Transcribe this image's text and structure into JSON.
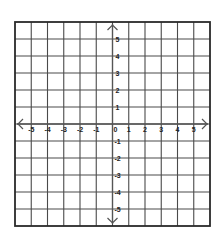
{
  "diagram": {
    "type": "coordinate-plane",
    "grid": {
      "left": 15,
      "top": 22,
      "right": 210,
      "bottom": 226,
      "columns": 12,
      "rows": 12,
      "line_color": "#4a4a4a",
      "border_color": "#2a2a2a"
    },
    "axes": {
      "color": "#555555",
      "x_axis_label_values": [
        "-5",
        "-4",
        "-3",
        "-2",
        "-1",
        "0",
        "1",
        "2",
        "3",
        "4",
        "5"
      ],
      "y_axis_label_values": [
        "5",
        "4",
        "3",
        "2",
        "1",
        "-1",
        "-2",
        "-3",
        "-4",
        "-5"
      ],
      "origin_label": "0",
      "x_range": [
        -6,
        6
      ],
      "y_range": [
        -6,
        6
      ]
    },
    "labels": {
      "x": [
        {
          "value": "-5",
          "col": 1
        },
        {
          "value": "-4",
          "col": 2
        },
        {
          "value": "-3",
          "col": 3
        },
        {
          "value": "-2",
          "col": 4
        },
        {
          "value": "-1",
          "col": 5
        },
        {
          "value": "0",
          "col": 6
        },
        {
          "value": "1",
          "col": 7
        },
        {
          "value": "2",
          "col": 8
        },
        {
          "value": "3",
          "col": 9
        },
        {
          "value": "4",
          "col": 10
        },
        {
          "value": "5",
          "col": 11
        }
      ],
      "y": [
        {
          "value": "5",
          "row": 1
        },
        {
          "value": "4",
          "row": 2
        },
        {
          "value": "3",
          "row": 3
        },
        {
          "value": "2",
          "row": 4
        },
        {
          "value": "1",
          "row": 5
        },
        {
          "value": "-1",
          "row": 7
        },
        {
          "value": "-2",
          "row": 8
        },
        {
          "value": "-3",
          "row": 9
        },
        {
          "value": "-4",
          "row": 10
        },
        {
          "value": "-5",
          "row": 11
        }
      ]
    }
  }
}
